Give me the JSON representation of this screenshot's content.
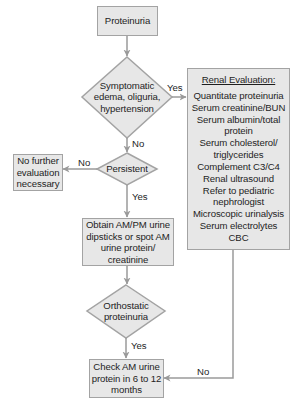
{
  "flowchart": {
    "start": {
      "label": "Proteinuria"
    },
    "decision_symptomatic": {
      "lines": [
        "Symptomatic",
        "edema, oliguria,",
        "hypertension"
      ]
    },
    "renal_evaluation": {
      "title": "Renal Evaluation:",
      "items": [
        [
          "Quantitate proteinuria"
        ],
        [
          "Serum creatinine/BUN"
        ],
        [
          "Serum albumin/total",
          "protein"
        ],
        [
          "Serum cholesterol/",
          "triglycerides"
        ],
        [
          "Complement C3/C4"
        ],
        [
          "Renal ultrasound"
        ],
        [
          "Refer to pediatric",
          "nephrologist"
        ],
        [
          "Microscopic urinalysis"
        ],
        [
          "Serum electrolytes"
        ],
        [
          "CBC"
        ]
      ]
    },
    "decision_persistent": {
      "label": "Persistent"
    },
    "no_further": {
      "lines": [
        "No further",
        "evaluation",
        "necessary"
      ]
    },
    "obtain_samples": {
      "lines": [
        "Obtain AM/PM urine",
        "dipsticks or spot AM",
        "urine protein/",
        "creatinine"
      ]
    },
    "decision_orthostatic": {
      "lines": [
        "Orthostatic",
        "proteinuria"
      ]
    },
    "check_am": {
      "lines": [
        "Check AM urine",
        "protein in 6 to 12",
        "months"
      ]
    },
    "edge_labels": {
      "symptomatic_yes": "Yes",
      "symptomatic_no": "No",
      "persistent_no": "No",
      "persistent_yes": "Yes",
      "orthostatic_yes": "Yes",
      "orthostatic_no": "No"
    }
  },
  "colors": {
    "box_fill": "#e7e7e7",
    "box_border": "#a3a3a3",
    "arrow": "#9a9a9a",
    "text": "#1e1e1e"
  }
}
